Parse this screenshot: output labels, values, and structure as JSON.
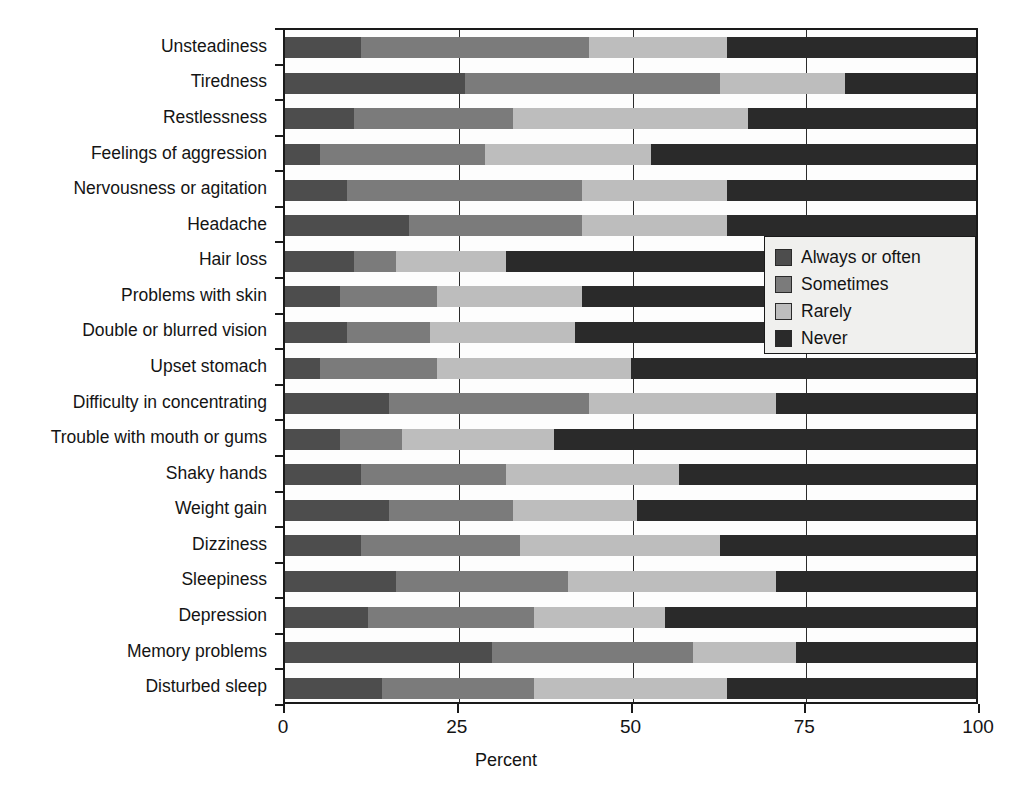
{
  "chart_data": {
    "type": "bar",
    "orientation": "horizontal",
    "stacked": true,
    "title": "",
    "xlabel": "Percent",
    "ylabel": "",
    "xlim": [
      0,
      100
    ],
    "xticks": [
      0,
      25,
      50,
      75,
      100
    ],
    "xticklabels": [
      "0",
      "25",
      "50",
      "75",
      "100"
    ],
    "grid": "vertical",
    "legend_position": "inside-right",
    "categories": [
      "Unsteadiness",
      "Tiredness",
      "Restlessness",
      "Feelings of aggression",
      "Nervousness or agitation",
      "Headache",
      "Hair loss",
      "Problems with skin",
      "Double or blurred vision",
      "Upset stomach",
      "Difficulty in concentrating",
      "Trouble with mouth or gums",
      "Shaky hands",
      "Weight gain",
      "Dizziness",
      "Sleepiness",
      "Depression",
      "Memory problems",
      "Disturbed sleep"
    ],
    "series": [
      {
        "name": "Always or often",
        "color": "#4d4d4d",
        "values": [
          11,
          26,
          10,
          5,
          9,
          18,
          10,
          8,
          9,
          5,
          15,
          8,
          11,
          15,
          11,
          16,
          12,
          30,
          14
        ]
      },
      {
        "name": "Sometimes",
        "color": "#7b7b7b",
        "values": [
          33,
          37,
          23,
          24,
          34,
          25,
          6,
          14,
          12,
          17,
          29,
          9,
          21,
          18,
          23,
          25,
          24,
          29,
          22
        ]
      },
      {
        "name": "Rarely",
        "color": "#bdbdbd",
        "values": [
          20,
          18,
          34,
          24,
          21,
          21,
          16,
          21,
          21,
          28,
          27,
          22,
          25,
          18,
          29,
          30,
          19,
          15,
          28
        ]
      },
      {
        "name": "Never",
        "color": "#2a2a2a",
        "values": [
          36,
          19,
          33,
          47,
          36,
          36,
          68,
          57,
          58,
          50,
          29,
          61,
          43,
          49,
          37,
          29,
          45,
          26,
          36
        ]
      }
    ]
  },
  "legend": {
    "items": [
      {
        "label": "Always or often",
        "color": "#4d4d4d"
      },
      {
        "label": "Sometimes",
        "color": "#7b7b7b"
      },
      {
        "label": "Rarely",
        "color": "#bdbdbd"
      },
      {
        "label": "Never",
        "color": "#2a2a2a"
      }
    ]
  },
  "axis": {
    "x_title": "Percent"
  }
}
